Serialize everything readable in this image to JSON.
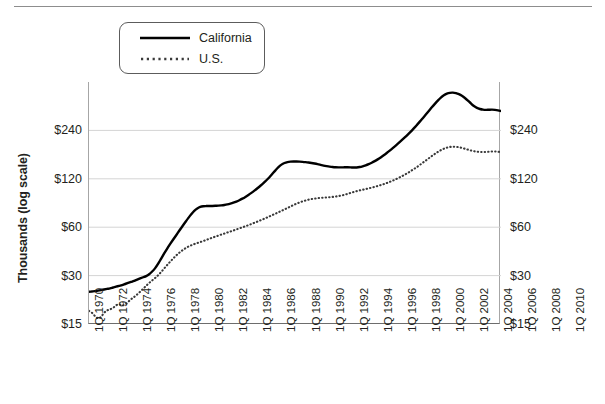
{
  "figure": {
    "y_axis_title": "Thousands (log scale)"
  },
  "legend": {
    "items": [
      {
        "label": "California",
        "style": "solid-line-swatch",
        "color": "#000000"
      },
      {
        "label": "U.S.",
        "style": "dotted-line-swatch",
        "color": "#3a3a3a"
      }
    ]
  },
  "axes": {
    "y_left_ticks": [
      "$240",
      "$120",
      "$60",
      "$30",
      "$15"
    ],
    "y_right_ticks": [
      "$240",
      "$120",
      "$60",
      "$30",
      "$15"
    ],
    "x_ticks": [
      "1Q 1970",
      "1Q 1972",
      "1Q 1974",
      "1Q 1976",
      "1Q 1978",
      "1Q 1980",
      "1Q 1982",
      "1Q 1984",
      "1Q 1986",
      "1Q 1988",
      "1Q 1990",
      "1Q 1992",
      "1Q 1994",
      "1Q 1996",
      "1Q 1998",
      "1Q 2000",
      "1Q 2002",
      "1Q 2004",
      "1Q 2006",
      "1Q 2008",
      "1Q 2010"
    ]
  },
  "chart_data": {
    "type": "line",
    "title": "",
    "subtitle": "",
    "xlabel": "",
    "ylabel": "Thousands (log scale)",
    "yscale": "log",
    "ylim": [
      15,
      480
    ],
    "ytick_values": [
      15,
      30,
      60,
      120,
      240
    ],
    "ytick_labels": [
      "$15",
      "$30",
      "$60",
      "$120",
      "$240"
    ],
    "grid": "horizontal",
    "legend_position": "top-left",
    "x_start": "1Q 1970",
    "x_end": "1Q 2011",
    "x_step": "quarterly",
    "x_labeled_every": "2 years",
    "series": [
      {
        "name": "California",
        "style": "solid",
        "color": "#000000",
        "values": [
          23.8,
          23.9,
          24.0,
          24.2,
          24.4,
          24.6,
          24.8,
          25.0,
          25.3,
          25.6,
          25.9,
          26.2,
          26.6,
          27.0,
          27.4,
          27.8,
          28.3,
          28.8,
          29.3,
          29.8,
          30.6,
          31.8,
          33.4,
          35.6,
          38.3,
          41.2,
          44.2,
          47.2,
          50.3,
          53.5,
          57.0,
          60.6,
          64.4,
          68.3,
          72.2,
          75.8,
          78.4,
          80.2,
          81.0,
          81.2,
          81.2,
          81.3,
          81.5,
          81.7,
          82.0,
          82.5,
          83.2,
          84.1,
          85.2,
          86.6,
          88.3,
          90.3,
          92.6,
          95.2,
          98.1,
          101.3,
          104.8,
          108.6,
          112.8,
          117.5,
          122.8,
          129.0,
          135.5,
          141.8,
          147.0,
          150.5,
          152.5,
          153.5,
          153.8,
          153.8,
          153.5,
          153.0,
          152.3,
          151.5,
          150.5,
          149.3,
          148.0,
          146.5,
          145.0,
          143.8,
          142.8,
          142.0,
          141.5,
          141.3,
          141.3,
          141.5,
          141.5,
          141.3,
          141.0,
          141.2,
          142.0,
          143.5,
          145.5,
          148.0,
          151.0,
          154.5,
          158.5,
          163.0,
          168.0,
          173.5,
          179.5,
          186.0,
          193.0,
          200.5,
          208.5,
          217.0,
          226.0,
          236.0,
          247.0,
          259.0,
          272.0,
          286.0,
          301.0,
          317.0,
          334.0,
          351.0,
          368.0,
          384.0,
          397.0,
          406.0,
          411.0,
          412.0,
          409.0,
          403.0,
          394.0,
          382.0,
          368.0,
          353.0,
          340.0,
          331.0,
          326.0,
          323.0,
          322.0,
          322.5,
          323.0,
          322.0,
          320.0,
          317.0
        ]
      },
      {
        "name": "U.S.",
        "style": "dotted",
        "color": "#3a3a3a",
        "values": [
          18.1,
          17.6,
          16.8,
          16.3,
          16.6,
          17.6,
          18.2,
          18.5,
          18.9,
          19.6,
          19.9,
          19.6,
          19.8,
          20.6,
          21.4,
          22.1,
          22.9,
          23.8,
          24.8,
          25.9,
          27.0,
          28.0,
          29.0,
          30.2,
          31.6,
          33.2,
          34.9,
          36.6,
          38.3,
          40.0,
          41.6,
          43.0,
          44.3,
          45.4,
          46.3,
          47.1,
          47.8,
          48.5,
          49.2,
          50.0,
          50.8,
          51.6,
          52.4,
          53.2,
          54.0,
          54.8,
          55.6,
          56.4,
          57.2,
          58.1,
          59.0,
          59.9,
          60.8,
          61.8,
          62.8,
          63.9,
          65.0,
          66.2,
          67.4,
          68.7,
          70.0,
          71.4,
          72.8,
          74.3,
          75.8,
          77.4,
          79.0,
          80.7,
          82.4,
          84.0,
          85.5,
          86.8,
          88.0,
          89.0,
          89.8,
          90.4,
          90.9,
          91.3,
          91.6,
          91.9,
          92.2,
          92.6,
          93.1,
          93.7,
          94.5,
          95.5,
          96.7,
          98.0,
          99.3,
          100.5,
          101.6,
          102.6,
          103.6,
          104.6,
          105.7,
          106.9,
          108.2,
          109.6,
          111.2,
          112.9,
          114.8,
          116.9,
          119.2,
          121.7,
          124.4,
          127.4,
          130.6,
          134.1,
          137.9,
          142.0,
          146.4,
          151.1,
          156.0,
          161.1,
          166.3,
          171.4,
          176.3,
          180.8,
          184.6,
          187.5,
          189.3,
          190.0,
          189.7,
          188.5,
          186.7,
          184.5,
          182.2,
          180.0,
          178.2,
          177.0,
          176.3,
          176.0,
          176.2,
          176.8,
          177.3,
          177.3,
          176.8,
          176.0
        ]
      }
    ]
  }
}
